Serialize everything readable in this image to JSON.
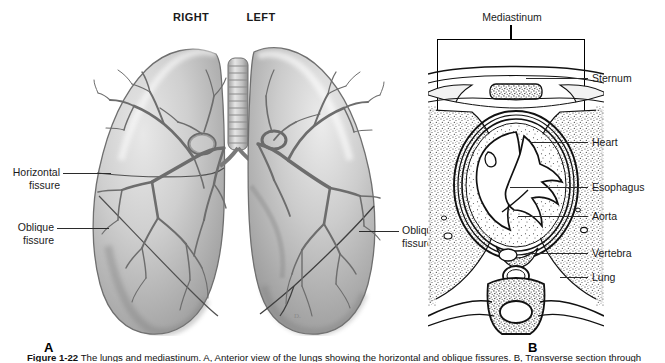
{
  "figure": {
    "caption_prefix": "Figure 1-22",
    "caption_text": "The lungs and mediastinum. A, Anterior view of the lungs showing the horizontal and oblique fissures. B, Transverse section through the thorax showing the mediastinum and its contents.",
    "panel_a_letter": "A",
    "panel_b_letter": "B"
  },
  "panel_a": {
    "name": "lungs-anterior-view",
    "headers": [
      {
        "id": "right",
        "label": "RIGHT"
      },
      {
        "id": "left",
        "label": "LEFT"
      }
    ],
    "labels": [
      {
        "id": "horizontal-fissure",
        "line1": "Horizontal",
        "line2": "fissure",
        "side": "left"
      },
      {
        "id": "oblique-fissure-left",
        "line1": "Oblique",
        "line2": "fissure",
        "side": "left"
      },
      {
        "id": "oblique-fissure-right",
        "line1": "Oblique",
        "line2": "fissure",
        "side": "right"
      }
    ]
  },
  "panel_b": {
    "name": "thorax-transverse-section",
    "bracket_label": "Mediastinum",
    "labels": [
      {
        "id": "sternum",
        "label": "Sternum"
      },
      {
        "id": "heart",
        "label": "Heart"
      },
      {
        "id": "esophagus",
        "label": "Esophagus"
      },
      {
        "id": "aorta",
        "label": "Aorta"
      },
      {
        "id": "vertebra",
        "label": "Vertebra"
      },
      {
        "id": "lung",
        "label": "Lung"
      }
    ]
  },
  "colors": {
    "ink": "#1a1a1a",
    "line": "#2b2b2b",
    "background": "#ffffff",
    "tissue_light": "#d9d9d9",
    "tissue_mid": "#9a9a9a",
    "tissue_dark": "#6b6b6b"
  }
}
